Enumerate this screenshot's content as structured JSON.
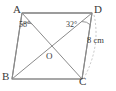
{
  "figure": {
    "type": "geometry-diagram",
    "shape": "parallelogram",
    "background_color": "#ffffff",
    "stroke_color": "#8a8a8a",
    "label_color": "#3a3a3a",
    "dashed_color": "#b5b5b5",
    "vertices": [
      {
        "name": "A",
        "label": "A",
        "x": 22,
        "y": 13
      },
      {
        "name": "D",
        "label": "D",
        "x": 92,
        "y": 13
      },
      {
        "name": "C",
        "label": "C",
        "x": 82,
        "y": 79
      },
      {
        "name": "B",
        "label": "B",
        "x": 12,
        "y": 79
      }
    ],
    "intersection": {
      "name": "O",
      "label": "O",
      "x": 51,
      "y": 57
    },
    "angles": [
      {
        "at": "A",
        "between": "AB-AC",
        "label": "58°",
        "value": 58,
        "unit": "degrees"
      },
      {
        "at": "D",
        "between": "DB-DC",
        "label": "32°",
        "value": 32,
        "unit": "degrees"
      }
    ],
    "measurements": [
      {
        "side": "DC",
        "label": "8 cm",
        "value": 8,
        "unit": "cm"
      }
    ],
    "diagonals": [
      "AC",
      "BD"
    ],
    "sides": [
      "AD",
      "DC",
      "CB",
      "BA"
    ]
  }
}
